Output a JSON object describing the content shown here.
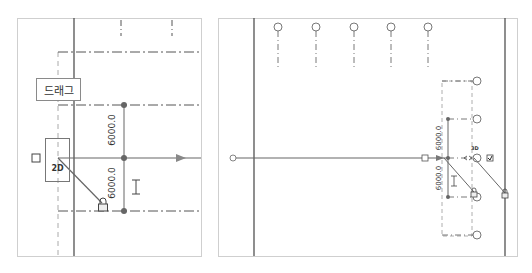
{
  "left_view": {
    "drag_tooltip": "드래그",
    "view_mode_badge": "2D",
    "dimensions": [
      {
        "value": "6000.0"
      },
      {
        "value": "6000.0"
      }
    ],
    "icons": [
      "checkbox-square-icon",
      "lock-icon",
      "i-beam-icon",
      "arrow-right-icon"
    ]
  },
  "right_view": {
    "view_mode_badge": "3D",
    "dimensions": [
      {
        "value": "6000.0"
      },
      {
        "value": "6000.0"
      }
    ],
    "grid_bubbles_top": [
      "A",
      "B",
      "C",
      "D",
      "E"
    ],
    "grid_bubbles_right": [
      "1",
      "2",
      "3",
      "4",
      "5"
    ],
    "icons": [
      "grid-end-circle-icon",
      "checkbox-square-icon",
      "checked-checkbox-icon",
      "lock-icon",
      "i-beam-icon"
    ]
  },
  "colors": {
    "line": "#555555",
    "dim_point": "#666666",
    "frame": "#cfcfcf"
  }
}
